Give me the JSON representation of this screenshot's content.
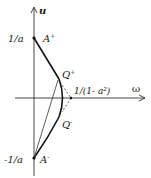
{
  "diagram": {
    "axes": {
      "vertical_label": "u",
      "horizontal_label": "ω"
    },
    "tick_labels": {
      "top": "1/a",
      "bottom": "-1/a",
      "right_point": "1/(1- a²)"
    },
    "points": {
      "a_plus": {
        "base": "A",
        "sup": "+"
      },
      "a_minus": {
        "base": "A",
        "sup": "-"
      },
      "q_plus": {
        "base": "Q",
        "sup": "+"
      },
      "q_minus": {
        "base": "Q",
        "sup": "-"
      }
    },
    "colors": {
      "ink": "#1a1a1a",
      "background": "#ffffff"
    }
  }
}
